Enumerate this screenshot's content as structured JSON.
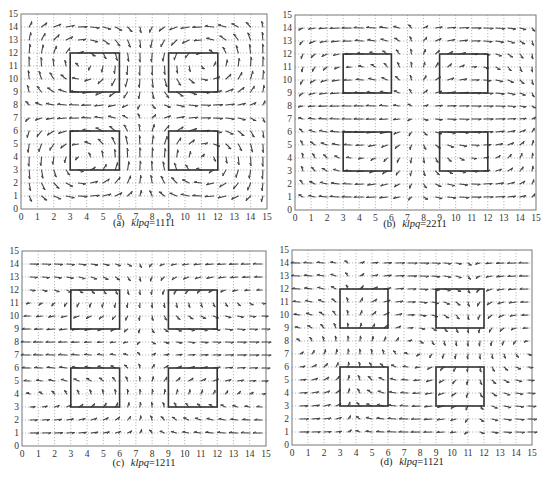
{
  "figure": {
    "panels": [
      {
        "id": "a",
        "label": "(a)",
        "param_name": "klpq",
        "param_value": "=1111"
      },
      {
        "id": "b",
        "label": "(b)",
        "param_name": "klpq",
        "param_value": "=2211"
      },
      {
        "id": "c",
        "label": "(c)",
        "param_name": "klpq",
        "param_value": "=1211"
      },
      {
        "id": "d",
        "label": "(d)",
        "param_name": "klpq",
        "param_value": "=1121"
      }
    ]
  },
  "chart_data": [
    {
      "type": "scatter",
      "subtype": "quiver",
      "title": "(a) klpq=1111",
      "xlabel": "",
      "ylabel": "",
      "xlim": [
        0,
        15
      ],
      "ylim": [
        0,
        15
      ],
      "xticks": [
        0,
        1,
        2,
        3,
        4,
        5,
        6,
        7,
        8,
        9,
        10,
        11,
        12,
        13,
        14,
        15
      ],
      "yticks": [
        0,
        1,
        2,
        3,
        4,
        5,
        6,
        7,
        8,
        9,
        10,
        11,
        12,
        13,
        14,
        15
      ],
      "grid": true,
      "rectangles": [
        {
          "x0": 3,
          "y0": 9,
          "x1": 6,
          "y1": 12
        },
        {
          "x0": 9,
          "y0": 9,
          "x1": 12,
          "y1": 12
        },
        {
          "x0": 3,
          "y0": 3,
          "x1": 6,
          "y1": 6
        },
        {
          "x0": 9,
          "y0": 3,
          "x1": 12,
          "y1": 6
        }
      ],
      "field_mode": "1111"
    },
    {
      "type": "scatter",
      "subtype": "quiver",
      "title": "(b) klpq=2211",
      "xlabel": "",
      "ylabel": "",
      "xlim": [
        0,
        15
      ],
      "ylim": [
        0,
        15
      ],
      "xticks": [
        0,
        1,
        2,
        3,
        4,
        5,
        6,
        7,
        8,
        9,
        10,
        11,
        12,
        13,
        14,
        15
      ],
      "yticks": [
        0,
        1,
        2,
        3,
        4,
        5,
        6,
        7,
        8,
        9,
        10,
        11,
        12,
        13,
        14,
        15
      ],
      "grid": true,
      "rectangles": [
        {
          "x0": 3,
          "y0": 9,
          "x1": 6,
          "y1": 12
        },
        {
          "x0": 9,
          "y0": 9,
          "x1": 12,
          "y1": 12
        },
        {
          "x0": 3,
          "y0": 3,
          "x1": 6,
          "y1": 6
        },
        {
          "x0": 9,
          "y0": 3,
          "x1": 12,
          "y1": 6
        }
      ],
      "field_mode": "2211"
    },
    {
      "type": "scatter",
      "subtype": "quiver",
      "title": "(c) klpq=1211",
      "xlabel": "",
      "ylabel": "",
      "xlim": [
        0,
        15
      ],
      "ylim": [
        0,
        15
      ],
      "xticks": [
        0,
        1,
        2,
        3,
        4,
        5,
        6,
        7,
        8,
        9,
        10,
        11,
        12,
        13,
        14,
        15
      ],
      "yticks": [
        0,
        1,
        2,
        3,
        4,
        5,
        6,
        7,
        8,
        9,
        10,
        11,
        12,
        13,
        14,
        15
      ],
      "grid": true,
      "rectangles": [
        {
          "x0": 3,
          "y0": 9,
          "x1": 6,
          "y1": 12
        },
        {
          "x0": 9,
          "y0": 9,
          "x1": 12,
          "y1": 12
        },
        {
          "x0": 3,
          "y0": 3,
          "x1": 6,
          "y1": 6
        },
        {
          "x0": 9,
          "y0": 3,
          "x1": 12,
          "y1": 6
        }
      ],
      "field_mode": "1211"
    },
    {
      "type": "scatter",
      "subtype": "quiver",
      "title": "(d) klpq=1121",
      "xlabel": "",
      "ylabel": "",
      "xlim": [
        0,
        15
      ],
      "ylim": [
        0,
        15
      ],
      "xticks": [
        0,
        1,
        2,
        3,
        4,
        5,
        6,
        7,
        8,
        9,
        10,
        11,
        12,
        13,
        14,
        15
      ],
      "yticks": [
        0,
        1,
        2,
        3,
        4,
        5,
        6,
        7,
        8,
        9,
        10,
        11,
        12,
        13,
        14,
        15
      ],
      "grid": true,
      "rectangles": [
        {
          "x0": 3,
          "y0": 9,
          "x1": 6,
          "y1": 12
        },
        {
          "x0": 9,
          "y0": 9,
          "x1": 12,
          "y1": 12
        },
        {
          "x0": 3,
          "y0": 3,
          "x1": 6,
          "y1": 6
        },
        {
          "x0": 9,
          "y0": 3,
          "x1": 12,
          "y1": 6
        }
      ],
      "field_mode": "1121"
    }
  ]
}
